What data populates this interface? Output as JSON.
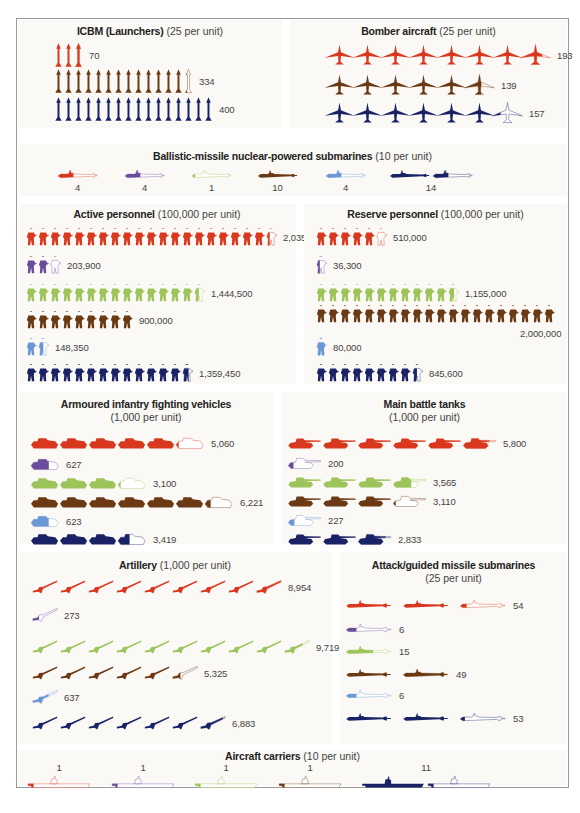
{
  "colors": {
    "series_1": "#d9381e",
    "series_2": "#6b4c9a",
    "series_3": "#9dc45a",
    "series_4": "#6b3a14",
    "series_5": "#6b96d6",
    "series_6": "#1a2266",
    "outline": "#ffffff",
    "panel_bg": "#fbf9f5",
    "frame_border": "#9a9a9a"
  },
  "panels": {
    "icbm": {
      "title": "ICBM (Launchers)",
      "unit": "(25 per unit)"
    },
    "bombers": {
      "title": "Bomber aircraft",
      "unit": "(25 per unit)"
    },
    "ssbn": {
      "title": "Ballistic-missile nuclear-powered submarines",
      "unit": "(10 per unit)"
    },
    "active": {
      "title": "Active personnel",
      "unit": "(100,000 per unit)"
    },
    "reserve": {
      "title": "Reserve personnel",
      "unit": "(100,000 per unit)"
    },
    "aifv": {
      "title": "Armoured infantry fighting vehicles",
      "unit": "(1,000 per unit)"
    },
    "mbt": {
      "title": "Main battle tanks",
      "unit": "(1,000 per unit)"
    },
    "artillery": {
      "title": "Artillery",
      "unit": "(1,000 per unit)"
    },
    "attack_subs": {
      "title": "Attack/guided missile submarines",
      "unit": "(25 per unit)"
    },
    "carriers": {
      "title": "Aircraft carriers",
      "unit": "(10 per unit)"
    }
  },
  "chart_data": [
    {
      "type": "pictogram",
      "title": "ICBM (Launchers) (25 per unit)",
      "unit_value": 25,
      "series": [
        {
          "name": "series_1",
          "color": "#d9381e",
          "value": 70,
          "label": "70"
        },
        {
          "name": "series_4",
          "color": "#6b3a14",
          "value": 334,
          "label": "334"
        },
        {
          "name": "series_6",
          "color": "#1a2266",
          "value": 400,
          "label": "400"
        }
      ]
    },
    {
      "type": "pictogram",
      "title": "Bomber aircraft (25 per unit)",
      "unit_value": 25,
      "series": [
        {
          "name": "series_1",
          "color": "#d9381e",
          "value": 193,
          "label": "193"
        },
        {
          "name": "series_4",
          "color": "#6b3a14",
          "value": 139,
          "label": "139"
        },
        {
          "name": "series_6",
          "color": "#1a2266",
          "value": 157,
          "label": "157"
        }
      ]
    },
    {
      "type": "pictogram",
      "title": "Ballistic-missile nuclear-powered submarines (10 per unit)",
      "unit_value": 10,
      "series": [
        {
          "name": "series_1",
          "color": "#d9381e",
          "value": 4,
          "label": "4"
        },
        {
          "name": "series_2",
          "color": "#6b4c9a",
          "value": 4,
          "label": "4"
        },
        {
          "name": "series_3",
          "color": "#9dc45a",
          "value": 1,
          "label": "1"
        },
        {
          "name": "series_4",
          "color": "#6b3a14",
          "value": 10,
          "label": "10"
        },
        {
          "name": "series_5",
          "color": "#6b96d6",
          "value": 4,
          "label": "4"
        },
        {
          "name": "series_6",
          "color": "#1a2266",
          "value": 14,
          "label": "14"
        }
      ]
    },
    {
      "type": "pictogram",
      "title": "Active personnel (100,000 per unit)",
      "unit_value": 100000,
      "series": [
        {
          "name": "series_1",
          "color": "#d9381e",
          "value": 2035000,
          "label": "2,035,000"
        },
        {
          "name": "series_2",
          "color": "#6b4c9a",
          "value": 203900,
          "label": "203,900"
        },
        {
          "name": "series_3",
          "color": "#9dc45a",
          "value": 1444500,
          "label": "1,444,500"
        },
        {
          "name": "series_4",
          "color": "#6b3a14",
          "value": 900000,
          "label": "900,000"
        },
        {
          "name": "series_5",
          "color": "#6b96d6",
          "value": 148350,
          "label": "148,350"
        },
        {
          "name": "series_6",
          "color": "#1a2266",
          "value": 1359450,
          "label": "1,359,450"
        }
      ]
    },
    {
      "type": "pictogram",
      "title": "Reserve personnel (100,000 per unit)",
      "unit_value": 100000,
      "series": [
        {
          "name": "series_1",
          "color": "#d9381e",
          "value": 510000,
          "label": "510,000"
        },
        {
          "name": "series_2",
          "color": "#6b4c9a",
          "value": 36300,
          "label": "36,300"
        },
        {
          "name": "series_3",
          "color": "#9dc45a",
          "value": 1155000,
          "label": "1,155,000"
        },
        {
          "name": "series_4",
          "color": "#6b3a14",
          "value": 2000000,
          "label": "2,000,000"
        },
        {
          "name": "series_5",
          "color": "#6b96d6",
          "value": 80000,
          "label": "80,000"
        },
        {
          "name": "series_6",
          "color": "#1a2266",
          "value": 845600,
          "label": "845,600"
        }
      ]
    },
    {
      "type": "pictogram",
      "title": "Armoured infantry fighting vehicles (1,000 per unit)",
      "unit_value": 1000,
      "series": [
        {
          "name": "series_1",
          "color": "#d9381e",
          "value": 5060,
          "label": "5,060"
        },
        {
          "name": "series_2",
          "color": "#6b4c9a",
          "value": 627,
          "label": "627"
        },
        {
          "name": "series_3",
          "color": "#9dc45a",
          "value": 3100,
          "label": "3,100"
        },
        {
          "name": "series_4",
          "color": "#6b3a14",
          "value": 6221,
          "label": "6,221"
        },
        {
          "name": "series_5",
          "color": "#6b96d6",
          "value": 623,
          "label": "623"
        },
        {
          "name": "series_6",
          "color": "#1a2266",
          "value": 3419,
          "label": "3,419"
        }
      ]
    },
    {
      "type": "pictogram",
      "title": "Main battle tanks (1,000 per unit)",
      "unit_value": 1000,
      "series": [
        {
          "name": "series_1",
          "color": "#d9381e",
          "value": 5800,
          "label": "5,800"
        },
        {
          "name": "series_2",
          "color": "#6b4c9a",
          "value": 200,
          "label": "200"
        },
        {
          "name": "series_3",
          "color": "#9dc45a",
          "value": 3565,
          "label": "3,565"
        },
        {
          "name": "series_4",
          "color": "#6b3a14",
          "value": 3110,
          "label": "3,110"
        },
        {
          "name": "series_5",
          "color": "#6b96d6",
          "value": 227,
          "label": "227"
        },
        {
          "name": "series_6",
          "color": "#1a2266",
          "value": 2833,
          "label": "2,833"
        }
      ]
    },
    {
      "type": "pictogram",
      "title": "Artillery (1,000 per unit)",
      "unit_value": 1000,
      "series": [
        {
          "name": "series_1",
          "color": "#d9381e",
          "value": 8954,
          "label": "8,954"
        },
        {
          "name": "series_2",
          "color": "#6b4c9a",
          "value": 273,
          "label": "273"
        },
        {
          "name": "series_3",
          "color": "#9dc45a",
          "value": 9719,
          "label": "9,719"
        },
        {
          "name": "series_4",
          "color": "#6b3a14",
          "value": 5325,
          "label": "5,325"
        },
        {
          "name": "series_5",
          "color": "#6b96d6",
          "value": 637,
          "label": "637"
        },
        {
          "name": "series_6",
          "color": "#1a2266",
          "value": 6883,
          "label": "6,883"
        }
      ]
    },
    {
      "type": "pictogram",
      "title": "Attack/guided missile submarines (25 per unit)",
      "unit_value": 25,
      "series": [
        {
          "name": "series_1",
          "color": "#d9381e",
          "value": 54,
          "label": "54"
        },
        {
          "name": "series_2",
          "color": "#6b4c9a",
          "value": 6,
          "label": "6"
        },
        {
          "name": "series_3",
          "color": "#9dc45a",
          "value": 15,
          "label": "15"
        },
        {
          "name": "series_4",
          "color": "#6b3a14",
          "value": 49,
          "label": "49"
        },
        {
          "name": "series_5",
          "color": "#6b96d6",
          "value": 6,
          "label": "6"
        },
        {
          "name": "series_6",
          "color": "#1a2266",
          "value": 53,
          "label": "53"
        }
      ]
    },
    {
      "type": "pictogram",
      "title": "Aircraft carriers (10 per unit)",
      "unit_value": 10,
      "series": [
        {
          "name": "series_1",
          "color": "#d9381e",
          "value": 1,
          "label": "1"
        },
        {
          "name": "series_2",
          "color": "#6b4c9a",
          "value": 1,
          "label": "1"
        },
        {
          "name": "series_3",
          "color": "#9dc45a",
          "value": 1,
          "label": "1"
        },
        {
          "name": "series_4",
          "color": "#6b3a14",
          "value": 1,
          "label": "1"
        },
        {
          "name": "series_6",
          "color": "#1a2266",
          "value": 11,
          "label": "11"
        }
      ]
    }
  ]
}
